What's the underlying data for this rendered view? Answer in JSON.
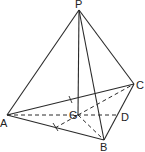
{
  "figure": {
    "points": {
      "P": {
        "label": "P",
        "x": 79,
        "y": 10
      },
      "A": {
        "label": "A",
        "x": 7,
        "y": 115
      },
      "B": {
        "label": "B",
        "x": 104,
        "y": 140
      },
      "C": {
        "label": "C",
        "x": 134,
        "y": 84
      },
      "G": {
        "label": "G",
        "x": 78,
        "y": 115
      },
      "D": {
        "label": "D",
        "x": 119,
        "y": 115
      }
    },
    "solid_edges": [
      "PA",
      "PB",
      "PC",
      "PG",
      "AB",
      "AC",
      "BC"
    ],
    "dashed_edges": [
      "AD",
      "GC",
      "GB",
      "MG"
    ],
    "colors": {
      "line": "#2a2a2a",
      "background": "#ffffff"
    }
  }
}
